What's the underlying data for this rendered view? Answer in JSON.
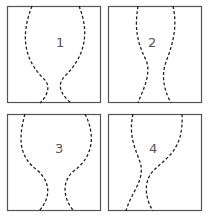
{
  "figure": {
    "border_color": "#555555",
    "curve_color": "#222222",
    "panels": [
      {
        "label": "1",
        "x": 7,
        "y": 6,
        "label_x": 49,
        "label_y": 30,
        "left_path": "M25 0 C 14 28, 16 52, 36 72 C 45 80, 40 90, 33 97",
        "right_path": "M72 0 C 84 30, 76 52, 58 70 C 48 80, 56 90, 64 97"
      },
      {
        "label": "2",
        "x": 108,
        "y": 6,
        "label_x": 40,
        "label_y": 30,
        "left_path": "M30 0 C 26 24, 30 38, 38 54 C 44 68, 34 86, 30 97",
        "right_path": "M65 0 C 70 22, 64 40, 58 56 C 52 72, 58 88, 63 97"
      },
      {
        "label": "3",
        "x": 7,
        "y": 114,
        "label_x": 48,
        "label_y": 28,
        "left_path": "M18 0 C 10 28, 14 44, 30 56 C 46 70, 42 86, 32 97",
        "right_path": "M78 0 C 90 24, 84 44, 68 56 C 52 68, 58 88, 67 97"
      },
      {
        "label": "4",
        "x": 108,
        "y": 114,
        "label_x": 41,
        "label_y": 28,
        "left_path": "M25 0 C 20 22, 28 36, 32 48 C 38 66, 22 80, 18 97",
        "right_path": "M74 0 C 76 36, 58 44, 46 56 C 34 68, 38 86, 45 97"
      }
    ]
  }
}
